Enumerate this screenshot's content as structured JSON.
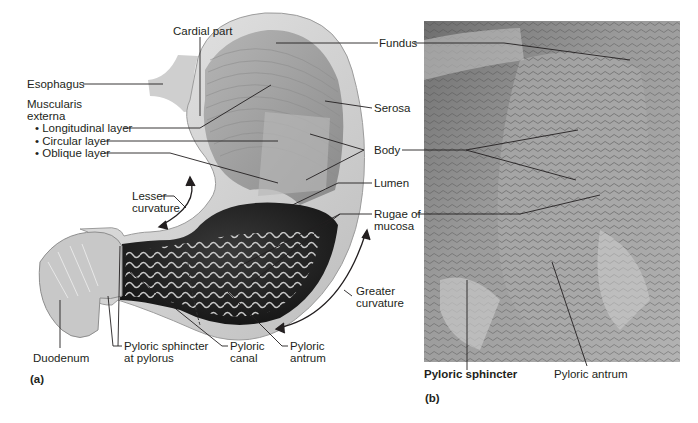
{
  "figure": {
    "panel_a": {
      "letter": "(a)",
      "labels": {
        "cardial_part": "Cardial part",
        "fundus": "Fundus",
        "esophagus": "Esophagus",
        "serosa": "Serosa",
        "muscularis_title_1": "Muscularis",
        "muscularis_title_2": "externa",
        "longitudinal": "• Longitudinal layer",
        "circular": "• Circular layer",
        "oblique": "• Oblique layer",
        "body": "Body",
        "lumen": "Lumen",
        "lesser_curvature_1": "Lesser",
        "lesser_curvature_2": "curvature",
        "rugae_1": "Rugae of",
        "rugae_2": "mucosa",
        "greater_curvature_1": "Greater",
        "greater_curvature_2": "curvature",
        "duodenum": "Duodenum",
        "pyloric_sphincter_1": "Pyloric sphincter",
        "pyloric_sphincter_2": "at pylorus",
        "pyloric_canal_1": "Pyloric",
        "pyloric_canal_2": "canal",
        "pyloric_antrum_1": "Pyloric",
        "pyloric_antrum_2": "antrum"
      }
    },
    "panel_b": {
      "letter": "(b)",
      "labels": {
        "pyloric_sphincter": "Pyloric sphincter",
        "pyloric_antrum": "Pyloric antrum"
      }
    },
    "colors": {
      "background": "#ffffff",
      "text": "#231f20",
      "leader_line": "#231f20",
      "stomach_outer": "#d9d9d9",
      "stomach_muscle": "#a8a8a8",
      "photo_base": "#8f8f8f"
    }
  }
}
